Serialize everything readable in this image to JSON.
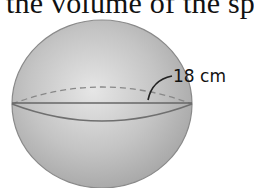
{
  "caption": "the volume of the sp",
  "figure": {
    "shape": "sphere",
    "radius_label": "18 cm",
    "fill_color": "#b9b9b9",
    "edge_color": "#7a7a7a"
  }
}
